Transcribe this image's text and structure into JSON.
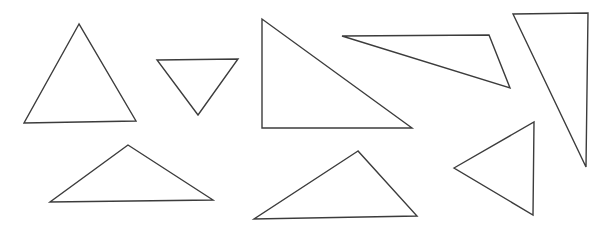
{
  "canvas": {
    "width": 607,
    "height": 232,
    "background_color": "#ffffff"
  },
  "style": {
    "stroke_color": "#3c3c3c",
    "stroke_width": 1.4,
    "fill": "none"
  },
  "diagram": {
    "type": "line-drawing",
    "shape_count": 8,
    "shapes": [
      {
        "id": "triangle-1",
        "name": "large-upright-triangle-left",
        "orientation": "apex-up",
        "points": "79,24 24,123 136,121"
      },
      {
        "id": "triangle-2",
        "name": "small-inverted-triangle",
        "orientation": "apex-down",
        "points": "157,60 238,59 198,115"
      },
      {
        "id": "triangle-3",
        "name": "right-triangle-large",
        "orientation": "right-angle-bottom-left",
        "points": "262,19 262,128 412,128"
      },
      {
        "id": "triangle-4",
        "name": "thin-wedge-triangle",
        "orientation": "point-left",
        "points": "342,36 489,35 510,88"
      },
      {
        "id": "triangle-5",
        "name": "tall-narrow-triangle",
        "orientation": "apex-down-right",
        "points": "513,14 588,13 586,167"
      },
      {
        "id": "triangle-6",
        "name": "left-pointing-triangle",
        "orientation": "point-left",
        "points": "454,168 534,122 533,215"
      },
      {
        "id": "triangle-7",
        "name": "wide-flat-triangle-left",
        "orientation": "apex-up",
        "points": "128,145 50,202 213,200"
      },
      {
        "id": "triangle-8",
        "name": "wide-obtuse-triangle-center",
        "orientation": "apex-up",
        "points": "358,151 254,219 417,216"
      }
    ]
  }
}
